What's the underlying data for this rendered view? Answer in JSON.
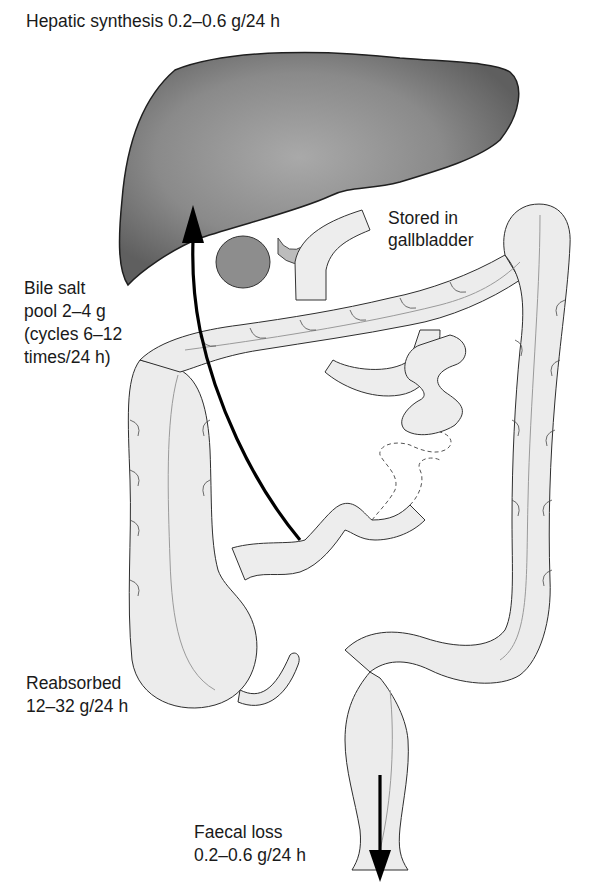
{
  "labels": {
    "hepatic_synthesis": "Hepatic synthesis 0.2–0.6 g/24 h",
    "stored_line1": "Stored in",
    "stored_line2": "gallbladder",
    "pool_line1": "Bile salt",
    "pool_line2": "pool 2–4 g",
    "pool_line3": "(cycles 6–12",
    "pool_line4": "times/24 h)",
    "reabsorbed_line1": "Reabsorbed",
    "reabsorbed_line2": "12–32 g/24 h",
    "faecal_line1": "Faecal loss",
    "faecal_line2": "0.2–0.6 g/24 h"
  },
  "colors": {
    "liver": "#6e6e6e",
    "liver_highlight": "#a4a4a4",
    "bowel": "#ececec",
    "outline": "#2b2b2b",
    "arrow": "#000000"
  }
}
